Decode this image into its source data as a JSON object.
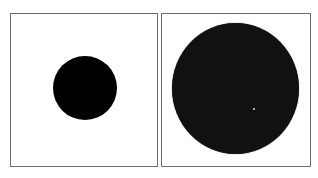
{
  "figure": {
    "panels": [
      {
        "id": "left",
        "shape": "circle",
        "size": "small",
        "fill": "#000000"
      },
      {
        "id": "right",
        "shape": "circle",
        "size": "large",
        "fill": "#111111"
      }
    ],
    "border_color": "#6e6e6e",
    "background": "#ffffff"
  }
}
